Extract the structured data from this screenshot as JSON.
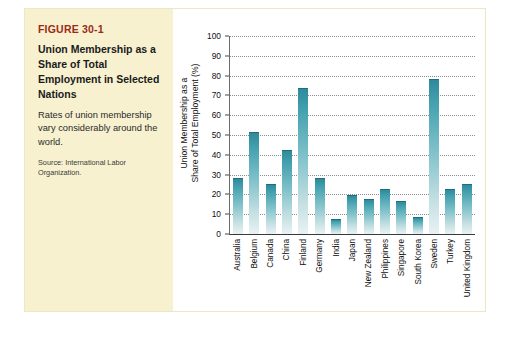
{
  "figure": {
    "number": "FIGURE 30-1",
    "title": "Union Membership as a Share of Total Employment in Selected Nations",
    "description": "Rates of union membership vary considerably around the world.",
    "source": "Source: International Labor Organization.",
    "accent_color": "#9c2a18",
    "panel_color": "#f7f1cf",
    "bar_color": "#3f9cab"
  },
  "chart_data": {
    "type": "bar",
    "title": "",
    "xlabel": "",
    "ylabel": "Union Membership as a Share of Total Employment (%)",
    "ylabel_line1": "Union Membership as a",
    "ylabel_line2": "Share of Total Employment (%)",
    "ylim": [
      0,
      100
    ],
    "yticks": [
      0,
      10,
      20,
      30,
      40,
      50,
      60,
      70,
      80,
      90,
      100
    ],
    "grid": true,
    "legend": "none",
    "categories": [
      "Australia",
      "Belgium",
      "Canada",
      "China",
      "Finland",
      "Germany",
      "India",
      "Japan",
      "New Zealand",
      "Philippines",
      "Singapore",
      "South Korea",
      "Sweden",
      "Turkey",
      "United Kingdom"
    ],
    "values": [
      28,
      51,
      25,
      42,
      73,
      28,
      7,
      19,
      17,
      22,
      16,
      8,
      78,
      22,
      25
    ]
  }
}
